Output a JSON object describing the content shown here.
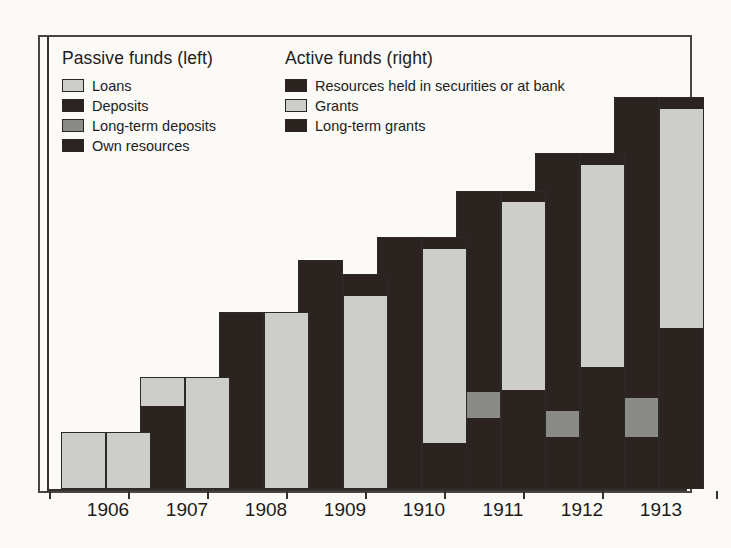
{
  "chart_data": {
    "type": "bar",
    "title": "",
    "subtitle": "",
    "xlabel": "",
    "ylabel": "",
    "grid": false,
    "axis": {
      "y_axis_visible": true,
      "y_ticks_visible": false,
      "baseline_visible": true
    },
    "categories": [
      "1906",
      "1907",
      "1908",
      "1909",
      "1910",
      "1911",
      "1912",
      "1913"
    ],
    "legend_position": "top-inside",
    "legends": [
      {
        "title": "Passive funds (left)",
        "entries": [
          {
            "label": "Loans",
            "color": "#cdcdc9",
            "key": "loans"
          },
          {
            "label": "Deposits",
            "color": "#2b2320",
            "key": "deposits"
          },
          {
            "label": "Long-term deposits",
            "color": "#8a8a86",
            "key": "long_term_deposits"
          },
          {
            "label": "Own resources",
            "color": "#2b2320",
            "key": "own_resources"
          }
        ]
      },
      {
        "title": "Active funds (right)",
        "entries": [
          {
            "label": "Resources held in securities or at bank",
            "color": "#2b2320",
            "key": "securities_or_bank"
          },
          {
            "label": "Grants",
            "color": "#cdcdc9",
            "key": "grants"
          },
          {
            "label": "Long-term grants",
            "color": "#2b2320",
            "key": "long_term_grants"
          }
        ]
      }
    ],
    "series": [
      {
        "name": "Passive funds (left bar)",
        "side": "left",
        "stack_order_bottom_to_top": [
          "own_resources",
          "long_term_deposits",
          "deposits",
          "loans"
        ],
        "values": [
          {
            "category": "1906",
            "total": 58,
            "own_resources": 0,
            "long_term_deposits": 0,
            "deposits": 0,
            "loans": 58
          },
          {
            "category": "1907",
            "total": 114,
            "own_resources": 0,
            "long_term_deposits": 0,
            "deposits": 84,
            "loans": 30
          },
          {
            "category": "1908",
            "total": 180,
            "own_resources": 0,
            "long_term_deposits": 0,
            "deposits": 180,
            "loans": 0
          },
          {
            "category": "1909",
            "total": 233,
            "own_resources": 0,
            "long_term_deposits": 0,
            "deposits": 233,
            "loans": 0
          },
          {
            "category": "1910",
            "total": 256,
            "own_resources": 0,
            "long_term_deposits": 0,
            "deposits": 256,
            "loans": 0
          },
          {
            "category": "1911",
            "total": 303,
            "own_resources": 72,
            "long_term_deposits": 26,
            "deposits": 205,
            "loans": 0
          },
          {
            "category": "1912",
            "total": 341,
            "own_resources": 53,
            "long_term_deposits": 26,
            "deposits": 262,
            "loans": 0
          },
          {
            "category": "1913",
            "total": 398,
            "own_resources": 53,
            "long_term_deposits": 39,
            "deposits": 306,
            "loans": 0
          }
        ]
      },
      {
        "name": "Active funds (right bar)",
        "side": "right",
        "stack_order_bottom_to_top": [
          "long_term_grants",
          "grants",
          "securities_or_bank"
        ],
        "values": [
          {
            "category": "1906",
            "total": 58,
            "long_term_grants": 0,
            "grants": 58,
            "securities_or_bank": 0
          },
          {
            "category": "1907",
            "total": 114,
            "long_term_grants": 0,
            "grants": 114,
            "securities_or_bank": 0
          },
          {
            "category": "1908",
            "total": 180,
            "long_term_grants": 0,
            "grants": 180,
            "securities_or_bank": 0
          },
          {
            "category": "1909",
            "total": 218,
            "long_term_grants": 0,
            "grants": 196,
            "securities_or_bank": 22
          },
          {
            "category": "1910",
            "total": 256,
            "long_term_grants": 47,
            "grants": 197,
            "securities_or_bank": 12
          },
          {
            "category": "1911",
            "total": 303,
            "long_term_grants": 101,
            "grants": 190,
            "securities_or_bank": 12
          },
          {
            "category": "1912",
            "total": 341,
            "long_term_grants": 124,
            "grants": 205,
            "securities_or_bank": 12
          },
          {
            "category": "1913",
            "total": 398,
            "long_term_grants": 163,
            "grants": 223,
            "securities_or_bank": 12
          }
        ]
      }
    ]
  },
  "palette": {
    "light": "#cdcdc9",
    "mid": "#8a8a86",
    "dark": "#2b2320",
    "outline": "#2d2926",
    "paper": "#fbfaf7",
    "ink": "#1d1a18"
  },
  "layout": {
    "plot_px": {
      "baseline_y": 454,
      "max_value": 398,
      "max_px": 392
    },
    "groups_px": [
      {
        "category": "1906",
        "left_x": 21,
        "right_x": 66,
        "center_x": 68
      },
      {
        "category": "1907",
        "left_x": 100,
        "right_x": 145,
        "center_x": 147
      },
      {
        "category": "1908",
        "left_x": 179,
        "right_x": 224,
        "center_x": 226
      },
      {
        "category": "1909",
        "left_x": 258,
        "right_x": 303,
        "center_x": 305
      },
      {
        "category": "1910",
        "left_x": 337,
        "right_x": 382,
        "center_x": 384
      },
      {
        "category": "1911",
        "left_x": 416,
        "right_x": 461,
        "center_x": 463
      },
      {
        "category": "1912",
        "left_x": 495,
        "right_x": 540,
        "center_x": 542
      },
      {
        "category": "1913",
        "left_x": 574,
        "right_x": 619,
        "center_x": 621
      }
    ],
    "bar_width_px": 45
  }
}
